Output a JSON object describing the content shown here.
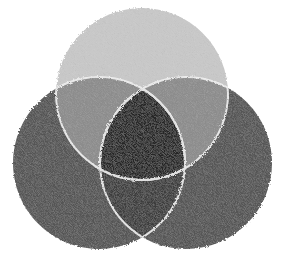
{
  "diagram": {
    "type": "venn-3-set",
    "style": "crayon-shaded grayscale",
    "background": "#ffffff",
    "circles": [
      {
        "id": "top",
        "cx": 142,
        "cy": 94,
        "r": 86
      },
      {
        "id": "left",
        "cx": 99,
        "cy": 163,
        "r": 86
      },
      {
        "id": "right",
        "cx": 186,
        "cy": 163,
        "r": 86
      }
    ],
    "region_colors": {
      "top_only": "#c9c9c9",
      "left_only": "#545454",
      "right_only": "#545454",
      "top_left": "#8c8c8c",
      "top_right": "#8c8c8c",
      "left_right": "#3d3d3d",
      "center": "#262626"
    },
    "outline_color": "#f2f2f2"
  }
}
